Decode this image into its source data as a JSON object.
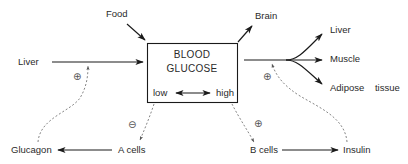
{
  "diagram": {
    "center_box": {
      "line1": "BLOOD",
      "line2": "GLUCOSE",
      "low_label": "low",
      "high_label": "high"
    },
    "inputs": {
      "food": "Food",
      "liver": "Liver"
    },
    "outputs": {
      "brain": "Brain",
      "liver": "Liver",
      "muscle": "Muscle",
      "adipose": "Adipose    tissue"
    },
    "hormones": {
      "glucagon": "Glucagon",
      "a_cells": "A cells",
      "b_cells": "B cells",
      "insulin": "Insulin"
    },
    "signs": {
      "plus": "⊕",
      "minus": "⊖"
    },
    "colors": {
      "line": "#1a1a1a",
      "dashed": "#777777",
      "text": "#2a2a2a",
      "background": "#ffffff"
    }
  }
}
